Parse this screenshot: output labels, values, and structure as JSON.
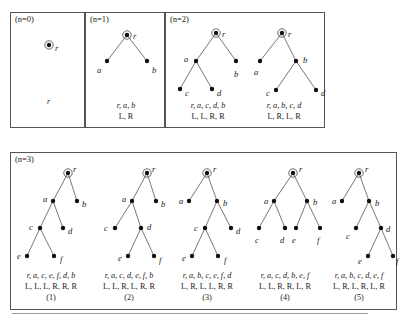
{
  "figure": {
    "title_hidden": "Fig. Binary trees",
    "node_radius": 2.2,
    "root_ring_radius": 4.2,
    "colors": {
      "stroke": "#555555",
      "node_fill": "#111111",
      "text": "#1a1a1a",
      "background": "#ffffff"
    }
  },
  "panels": [
    {
      "id": "n0",
      "label": "(n=0)",
      "x": 10,
      "y": 12,
      "w": 75,
      "h": 116,
      "trees": [
        {
          "id": "n0-t1",
          "x": 0,
          "y": 14,
          "w": 75,
          "h": 60,
          "root": "r",
          "nodes": [
            {
              "name": "r",
              "cx": 38,
              "cy": 18,
              "label": "r",
              "lx": 44,
              "ly": 21,
              "root": true
            }
          ],
          "edges": [],
          "caption": {
            "seq": "r",
            "lr": "",
            "x": 0,
            "y": 84,
            "w": 75
          },
          "number": ""
        }
      ]
    },
    {
      "id": "n1",
      "label": "(n=1)",
      "x": 85,
      "y": 12,
      "w": 80,
      "h": 116,
      "trees": [
        {
          "id": "n1-t1",
          "x": 0,
          "y": 10,
          "w": 80,
          "h": 62,
          "root": "r",
          "nodes": [
            {
              "name": "r",
              "cx": 41,
              "cy": 12,
              "label": "r",
              "lx": 47,
              "ly": 13,
              "root": true
            },
            {
              "name": "a",
              "cx": 21,
              "cy": 38,
              "label": "a",
              "lx": 11,
              "ly": 47,
              "root": false
            },
            {
              "name": "b",
              "cx": 61,
              "cy": 38,
              "label": "b",
              "lx": 66,
              "ly": 47,
              "root": false
            }
          ],
          "edges": [
            {
              "from": "r",
              "to": "a"
            },
            {
              "from": "r",
              "to": "b"
            }
          ],
          "caption": {
            "seq": "r, a, b",
            "lr": "L, R",
            "x": 0,
            "y": 88,
            "w": 80
          },
          "number": ""
        }
      ]
    },
    {
      "id": "n2",
      "label": "(n=2)",
      "x": 165,
      "y": 12,
      "w": 160,
      "h": 116,
      "trees": [
        {
          "id": "n2-t1",
          "x": 2,
          "y": 10,
          "w": 80,
          "h": 82,
          "root": "r",
          "nodes": [
            {
              "name": "r",
              "cx": 48,
              "cy": 10,
              "label": "r",
              "lx": 54,
              "ly": 11,
              "root": true
            },
            {
              "name": "a",
              "cx": 28,
              "cy": 38,
              "label": "a",
              "lx": 16,
              "ly": 36,
              "root": false
            },
            {
              "name": "b",
              "cx": 68,
              "cy": 38,
              "label": "b",
              "lx": 66,
              "ly": 51,
              "root": false
            },
            {
              "name": "c",
              "cx": 12,
              "cy": 66,
              "label": "c",
              "lx": 17,
              "ly": 70,
              "root": false
            },
            {
              "name": "d",
              "cx": 44,
              "cy": 66,
              "label": "d",
              "lx": 49,
              "ly": 70,
              "root": false
            }
          ],
          "edges": [
            {
              "from": "r",
              "to": "a"
            },
            {
              "from": "r",
              "to": "b"
            },
            {
              "from": "a",
              "to": "c"
            },
            {
              "from": "a",
              "to": "d"
            }
          ],
          "caption": {
            "seq": "r, a, c, d, b",
            "lr": "L, L, R, R",
            "x": 0,
            "y": 88,
            "w": 84
          },
          "number": ""
        },
        {
          "id": "n2-t2",
          "x": 80,
          "y": 10,
          "w": 80,
          "h": 82,
          "root": "r",
          "nodes": [
            {
              "name": "r",
              "cx": 36,
              "cy": 10,
              "label": "r",
              "lx": 42,
              "ly": 11,
              "root": true
            },
            {
              "name": "a",
              "cx": 14,
              "cy": 38,
              "label": "a",
              "lx": 8,
              "ly": 49,
              "root": false
            },
            {
              "name": "b",
              "cx": 50,
              "cy": 38,
              "label": "b",
              "lx": 57,
              "ly": 37,
              "root": false
            },
            {
              "name": "c",
              "cx": 30,
              "cy": 67,
              "label": "c",
              "lx": 20,
              "ly": 70,
              "root": false
            },
            {
              "name": "d",
              "cx": 70,
              "cy": 67,
              "label": "d",
              "lx": 75,
              "ly": 70,
              "root": false
            }
          ],
          "edges": [
            {
              "from": "r",
              "to": "a"
            },
            {
              "from": "r",
              "to": "b"
            },
            {
              "from": "b",
              "to": "c"
            },
            {
              "from": "b",
              "to": "d"
            }
          ],
          "caption": {
            "seq": "r, a, b, c, d",
            "lr": "L, R, L, R",
            "x": 76,
            "y": 88,
            "w": 84
          },
          "number": ""
        }
      ]
    },
    {
      "id": "n3",
      "label": "(n=3)",
      "x": 10,
      "y": 152,
      "w": 387,
      "h": 158,
      "trees": [
        {
          "id": "n3-t1",
          "x": 2,
          "y": 8,
          "w": 78,
          "h": 108,
          "root": "r",
          "nodes": [
            {
              "name": "r",
              "cx": 55,
              "cy": 12,
              "label": "r",
              "lx": 60,
              "ly": 8,
              "root": true
            },
            {
              "name": "a",
              "cx": 40,
              "cy": 40,
              "label": "a",
              "lx": 30,
              "ly": 38,
              "root": false
            },
            {
              "name": "b",
              "cx": 64,
              "cy": 40,
              "label": "b",
              "lx": 69,
              "ly": 43,
              "root": false
            },
            {
              "name": "c",
              "cx": 27,
              "cy": 67,
              "label": "c",
              "lx": 16,
              "ly": 66,
              "root": false
            },
            {
              "name": "d",
              "cx": 50,
              "cy": 67,
              "label": "d",
              "lx": 55,
              "ly": 70,
              "root": false
            },
            {
              "name": "e",
              "cx": 14,
              "cy": 95,
              "label": "e",
              "lx": 4,
              "ly": 95,
              "root": false
            },
            {
              "name": "f",
              "cx": 41,
              "cy": 95,
              "label": "f",
              "lx": 47,
              "ly": 98,
              "root": false
            }
          ],
          "edges": [
            {
              "from": "r",
              "to": "a"
            },
            {
              "from": "r",
              "to": "b"
            },
            {
              "from": "a",
              "to": "c"
            },
            {
              "from": "a",
              "to": "d"
            },
            {
              "from": "c",
              "to": "e"
            },
            {
              "from": "c",
              "to": "f"
            }
          ],
          "caption": {
            "seq": "r, a, c, e, f, d, b",
            "lr": "L, L, L, R, R, R",
            "x": -2,
            "y": 118,
            "w": 84
          },
          "number": "(1)"
        },
        {
          "id": "n3-t2",
          "x": 80,
          "y": 8,
          "w": 78,
          "h": 108,
          "root": "r",
          "nodes": [
            {
              "name": "r",
              "cx": 56,
              "cy": 12,
              "label": "r",
              "lx": 61,
              "ly": 8,
              "root": true
            },
            {
              "name": "a",
              "cx": 41,
              "cy": 40,
              "label": "a",
              "lx": 31,
              "ly": 38,
              "root": false
            },
            {
              "name": "b",
              "cx": 65,
              "cy": 40,
              "label": "b",
              "lx": 70,
              "ly": 43,
              "root": false
            },
            {
              "name": "c",
              "cx": 24,
              "cy": 67,
              "label": "c",
              "lx": 13,
              "ly": 67,
              "root": false
            },
            {
              "name": "d",
              "cx": 50,
              "cy": 67,
              "label": "d",
              "lx": 56,
              "ly": 66,
              "root": false
            },
            {
              "name": "e",
              "cx": 37,
              "cy": 95,
              "label": "e",
              "lx": 27,
              "ly": 97,
              "root": false
            },
            {
              "name": "f",
              "cx": 63,
              "cy": 95,
              "label": "f",
              "lx": 68,
              "ly": 99,
              "root": false
            }
          ],
          "edges": [
            {
              "from": "r",
              "to": "a"
            },
            {
              "from": "r",
              "to": "b"
            },
            {
              "from": "a",
              "to": "c"
            },
            {
              "from": "a",
              "to": "d"
            },
            {
              "from": "d",
              "to": "e"
            },
            {
              "from": "d",
              "to": "f"
            }
          ],
          "caption": {
            "seq": "r, a, c, d, e, f, b",
            "lr": "L, L, R, L, R, R",
            "x": 76,
            "y": 118,
            "w": 84
          },
          "number": "(2)"
        },
        {
          "id": "n3-t3",
          "x": 158,
          "y": 8,
          "w": 78,
          "h": 108,
          "root": "r",
          "nodes": [
            {
              "name": "r",
              "cx": 38,
              "cy": 12,
              "label": "r",
              "lx": 44,
              "ly": 8,
              "root": true
            },
            {
              "name": "a",
              "cx": 20,
              "cy": 40,
              "label": "a",
              "lx": 10,
              "ly": 40,
              "root": false
            },
            {
              "name": "b",
              "cx": 48,
              "cy": 40,
              "label": "b",
              "lx": 54,
              "ly": 42,
              "root": false
            },
            {
              "name": "c",
              "cx": 36,
              "cy": 67,
              "label": "c",
              "lx": 25,
              "ly": 67,
              "root": false
            },
            {
              "name": "d",
              "cx": 62,
              "cy": 67,
              "label": "d",
              "lx": 67,
              "ly": 70,
              "root": false
            },
            {
              "name": "e",
              "cx": 23,
              "cy": 95,
              "label": "e",
              "lx": 13,
              "ly": 97,
              "root": false
            },
            {
              "name": "f",
              "cx": 49,
              "cy": 95,
              "label": "f",
              "lx": 55,
              "ly": 99,
              "root": false
            }
          ],
          "edges": [
            {
              "from": "r",
              "to": "a"
            },
            {
              "from": "r",
              "to": "b"
            },
            {
              "from": "b",
              "to": "c"
            },
            {
              "from": "b",
              "to": "d"
            },
            {
              "from": "c",
              "to": "e"
            },
            {
              "from": "c",
              "to": "f"
            }
          ],
          "caption": {
            "seq": "r, a, b, c, e, f, d",
            "lr": "L, R, L, L, R, R",
            "x": 154,
            "y": 118,
            "w": 84
          },
          "number": "(3)"
        },
        {
          "id": "n3-t4",
          "x": 236,
          "y": 8,
          "w": 78,
          "h": 108,
          "root": "r",
          "nodes": [
            {
              "name": "r",
              "cx": 46,
              "cy": 12,
              "label": "r",
              "lx": 52,
              "ly": 8,
              "root": true
            },
            {
              "name": "a",
              "cx": 27,
              "cy": 40,
              "label": "a",
              "lx": 17,
              "ly": 40,
              "root": false
            },
            {
              "name": "b",
              "cx": 60,
              "cy": 40,
              "label": "b",
              "lx": 66,
              "ly": 41,
              "root": false
            },
            {
              "name": "c",
              "cx": 12,
              "cy": 67,
              "label": "c",
              "lx": 8,
              "ly": 79,
              "root": false
            },
            {
              "name": "d",
              "cx": 38,
              "cy": 67,
              "label": "d",
              "lx": 33,
              "ly": 79,
              "root": false
            },
            {
              "name": "e",
              "cx": 49,
              "cy": 67,
              "label": "e",
              "lx": 45,
              "ly": 79,
              "root": false
            },
            {
              "name": "f",
              "cx": 73,
              "cy": 67,
              "label": "f",
              "lx": 70,
              "ly": 79,
              "root": false
            }
          ],
          "edges": [
            {
              "from": "r",
              "to": "a"
            },
            {
              "from": "r",
              "to": "b"
            },
            {
              "from": "a",
              "to": "c"
            },
            {
              "from": "a",
              "to": "d"
            },
            {
              "from": "b",
              "to": "e"
            },
            {
              "from": "b",
              "to": "f"
            }
          ],
          "caption": {
            "seq": "r, a, c, d, b, e, f",
            "lr": "L, L, R, R, L, R",
            "x": 232,
            "y": 118,
            "w": 84
          },
          "number": "(4)"
        },
        {
          "id": "n3-t5",
          "x": 312,
          "y": 8,
          "w": 75,
          "h": 108,
          "root": "r",
          "nodes": [
            {
              "name": "r",
              "cx": 36,
              "cy": 12,
              "label": "r",
              "lx": 42,
              "ly": 8,
              "root": true
            },
            {
              "name": "a",
              "cx": 19,
              "cy": 40,
              "label": "a",
              "lx": 9,
              "ly": 40,
              "root": false
            },
            {
              "name": "b",
              "cx": 46,
              "cy": 40,
              "label": "b",
              "lx": 52,
              "ly": 42,
              "root": false
            },
            {
              "name": "c",
              "cx": 33,
              "cy": 67,
              "label": "c",
              "lx": 23,
              "ly": 75,
              "root": false
            },
            {
              "name": "d",
              "cx": 58,
              "cy": 67,
              "label": "d",
              "lx": 63,
              "ly": 68,
              "root": false
            },
            {
              "name": "e",
              "cx": 45,
              "cy": 95,
              "label": "e",
              "lx": 35,
              "ly": 100,
              "root": false
            },
            {
              "name": "f",
              "cx": 70,
              "cy": 95,
              "label": "f",
              "lx": 73,
              "ly": 100,
              "root": false
            }
          ],
          "edges": [
            {
              "from": "r",
              "to": "a"
            },
            {
              "from": "r",
              "to": "b"
            },
            {
              "from": "b",
              "to": "c"
            },
            {
              "from": "b",
              "to": "d"
            },
            {
              "from": "d",
              "to": "e"
            },
            {
              "from": "d",
              "to": "f"
            }
          ],
          "caption": {
            "seq": "r, a, b, c, d, e, f",
            "lr": "L, R, L, R, L, R",
            "x": 308,
            "y": 118,
            "w": 80
          },
          "number": "(5)"
        }
      ]
    }
  ],
  "footer": {
    "caption": ""
  }
}
